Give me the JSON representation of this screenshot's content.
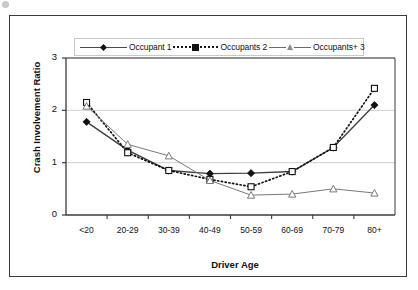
{
  "chart_data": {
    "type": "line",
    "title": "",
    "xlabel": "Driver Age",
    "ylabel": "Crash Involvement Ratio",
    "categories": [
      "<20",
      "20-29",
      "30-39",
      "40-49",
      "50-59",
      "60-69",
      "70-79",
      "80+"
    ],
    "ylim": [
      0,
      3
    ],
    "yticks": [
      0,
      1,
      2,
      3
    ],
    "grid": "horizontal",
    "legend_position": "top-center",
    "series": [
      {
        "name": "Occupant 1",
        "marker": "filled-diamond",
        "line": "solid",
        "values": [
          1.78,
          1.24,
          0.85,
          0.79,
          0.8,
          0.83,
          1.29,
          2.1
        ]
      },
      {
        "name": "Occupants 2",
        "marker": "filled-square",
        "line": "dotted",
        "values": [
          2.15,
          1.19,
          0.85,
          0.68,
          0.54,
          0.83,
          1.29,
          2.42
        ]
      },
      {
        "name": "Occupants+ 3",
        "marker": "open-triangle",
        "line": "solid-thin",
        "values": [
          2.08,
          1.35,
          1.13,
          0.66,
          0.38,
          0.4,
          0.5,
          0.42
        ]
      }
    ]
  },
  "legend": {
    "entries": [
      {
        "label": "Occupant 1"
      },
      {
        "label": "Occupants 2"
      },
      {
        "label": "Occupants+ 3"
      }
    ]
  },
  "axes": {
    "y_title": "Crash Involvement Ratio",
    "x_title": "Driver Age",
    "y_ticks": [
      "0",
      "1",
      "2",
      "3"
    ],
    "x_ticks": [
      "<20",
      "20-29",
      "30-39",
      "40-49",
      "50-59",
      "60-69",
      "70-79",
      "80+"
    ]
  }
}
